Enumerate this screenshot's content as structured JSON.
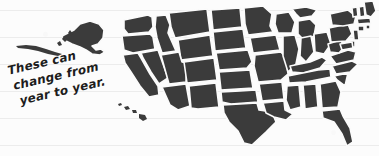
{
  "page": {
    "width": 379,
    "height": 156,
    "background_color": "#fcfcfc",
    "rule_line_color": "#ececec",
    "rule_line_y_positions": [
      10,
      37,
      64,
      91,
      118,
      145
    ]
  },
  "annotation": {
    "full_text": "These can change from year to year.",
    "line1": "These can",
    "line2": "change from",
    "line3": "year to year.",
    "ink_color": "#1d1d1d",
    "rotation_degrees": -13
  },
  "map": {
    "title": "United States map",
    "state_fill_color": "#3b3b3b",
    "state_border_color": "#fbfbfb",
    "includes_alaska": true,
    "includes_hawaii": true,
    "regions": [
      "Alaska",
      "Hawaii",
      "Washington",
      "Oregon",
      "California",
      "Nevada",
      "Idaho",
      "Montana",
      "Wyoming",
      "Utah",
      "Arizona",
      "Colorado",
      "New Mexico",
      "North Dakota",
      "South Dakota",
      "Nebraska",
      "Kansas",
      "Oklahoma",
      "Texas",
      "Minnesota",
      "Iowa",
      "Missouri",
      "Arkansas",
      "Louisiana",
      "Wisconsin",
      "Illinois",
      "Michigan",
      "Indiana",
      "Ohio",
      "Kentucky",
      "Tennessee",
      "Mississippi",
      "Alabama",
      "Georgia",
      "Florida",
      "South Carolina",
      "North Carolina",
      "Virginia",
      "West Virginia",
      "Pennsylvania",
      "New York",
      "Vermont",
      "New Hampshire",
      "Maine",
      "Massachusetts",
      "Rhode Island",
      "Connecticut",
      "New Jersey",
      "Delaware",
      "Maryland"
    ]
  }
}
